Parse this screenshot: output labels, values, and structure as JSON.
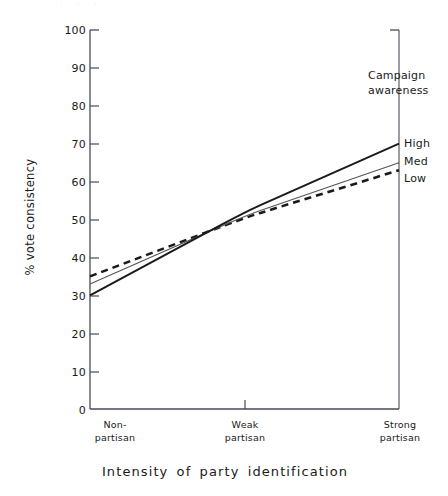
{
  "chart_data": {
    "type": "line",
    "title": "",
    "xlabel": "Intensity of party identification",
    "ylabel": "% vote consistency",
    "categories": [
      "Non-partisan",
      "Weak partisan",
      "Strong partisan"
    ],
    "category_lines": [
      [
        "Non-",
        "partisan"
      ],
      [
        "Weak",
        "partisan"
      ],
      [
        "Strong",
        "partisan"
      ]
    ],
    "ylim": [
      0,
      100
    ],
    "ytick_values": [
      0,
      10,
      20,
      30,
      40,
      50,
      60,
      70,
      80,
      90,
      100
    ],
    "ytick_labels": [
      "0",
      "10",
      "20",
      "30",
      "40",
      "50",
      "60",
      "70",
      "80",
      "90",
      "100"
    ],
    "grid": false,
    "legend_position": "right",
    "legend_title": "Campaign awareness",
    "legend_title_lines": [
      "Campaign",
      "awareness"
    ],
    "series": [
      {
        "name": "High",
        "style": "solid-thick",
        "color": "#1a1a1a",
        "values": [
          30,
          52,
          70
        ]
      },
      {
        "name": "Med",
        "style": "solid-thin",
        "color": "#555555",
        "values": [
          33,
          51,
          65
        ]
      },
      {
        "name": "Low",
        "style": "dashed",
        "color": "#1a1a1a",
        "values": [
          35,
          50.5,
          63
        ]
      }
    ]
  },
  "axis": {
    "color": "#4a4a55",
    "tick_length": 9
  },
  "artifact": {
    "top_strip": "· · ·"
  }
}
